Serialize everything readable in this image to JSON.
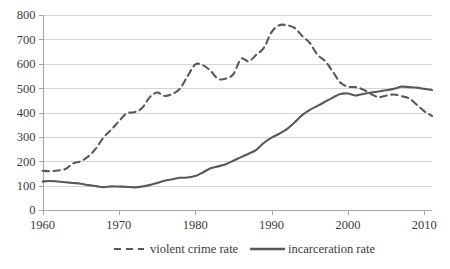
{
  "chart_data": {
    "type": "line",
    "title": "",
    "xlabel": "",
    "ylabel": "",
    "xlim": [
      1960,
      2011
    ],
    "ylim": [
      0,
      800
    ],
    "grid": true,
    "legend_position": "bottom",
    "x_ticks": [
      "1960",
      "1970",
      "1980",
      "1990",
      "2000",
      "2010"
    ],
    "x_tick_values": [
      1960,
      1970,
      1980,
      1990,
      2000,
      2010
    ],
    "y_ticks": [
      "0",
      "100",
      "200",
      "300",
      "400",
      "500",
      "600",
      "700",
      "800"
    ],
    "y_tick_values": [
      0,
      100,
      200,
      300,
      400,
      500,
      600,
      700,
      800
    ],
    "x": [
      1960,
      1961,
      1962,
      1963,
      1964,
      1965,
      1966,
      1967,
      1968,
      1969,
      1970,
      1971,
      1972,
      1973,
      1974,
      1975,
      1976,
      1977,
      1978,
      1979,
      1980,
      1981,
      1982,
      1983,
      1984,
      1985,
      1986,
      1987,
      1988,
      1989,
      1990,
      1991,
      1992,
      1993,
      1994,
      1995,
      1996,
      1997,
      1998,
      1999,
      2000,
      2001,
      2002,
      2003,
      2004,
      2005,
      2006,
      2007,
      2008,
      2009,
      2010,
      2011
    ],
    "series": [
      {
        "name": "violent crime rate",
        "style": "dashed",
        "color": "#595959",
        "values": [
          161,
          159,
          162,
          168,
          191,
          200,
          220,
          253,
          298,
          329,
          364,
          396,
          401,
          417,
          461,
          482,
          468,
          476,
          498,
          549,
          597,
          594,
          571,
          538,
          539,
          558,
          620,
          610,
          637,
          666,
          730,
          758,
          758,
          747,
          714,
          685,
          637,
          611,
          568,
          523,
          506,
          504,
          494,
          476,
          463,
          469,
          474,
          467,
          458,
          432,
          405,
          386
        ]
      },
      {
        "name": "incarceration rate",
        "style": "solid",
        "color": "#595959",
        "values": [
          117,
          119,
          117,
          114,
          111,
          108,
          102,
          98,
          94,
          97,
          96,
          95,
          93,
          96,
          102,
          111,
          120,
          126,
          132,
          133,
          139,
          154,
          171,
          179,
          188,
          202,
          217,
          231,
          247,
          276,
          297,
          313,
          332,
          359,
          389,
          411,
          427,
          444,
          461,
          476,
          478,
          470,
          476,
          482,
          486,
          491,
          497,
          506,
          504,
          502,
          497,
          492
        ]
      }
    ]
  },
  "legend": {
    "items": [
      {
        "label": "violent crime rate",
        "style": "dashed"
      },
      {
        "label": "incarceration rate",
        "style": "solid"
      }
    ]
  },
  "colors": {
    "line": "#595959",
    "gridline": "#d4d4d4",
    "axis": "#a6a6a6",
    "text": "#3b3b3b",
    "background": "#ffffff"
  }
}
